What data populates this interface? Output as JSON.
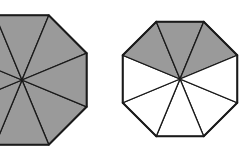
{
  "figure": {
    "background_color": "#ffffff",
    "shaded_color": "#9a9a9a",
    "unshaded_color": "#ffffff",
    "outline_color": "#1a1a1a",
    "sector_stroke_width": 1.3,
    "outline_stroke_width": 2.0,
    "shapes": [
      {
        "name": "left-octagon",
        "label": "left octagon",
        "sides": 8,
        "sectors_total": 8,
        "sectors_shaded": 8,
        "sectors_unshaded": 0,
        "fraction_shaded": "8/8",
        "center_x": 22,
        "center_y": 80,
        "radius": 70,
        "rotation_deg": 22.5,
        "clipped_at_left_edge": true,
        "sector_fills": [
          "shaded",
          "shaded",
          "shaded",
          "shaded",
          "shaded",
          "shaded",
          "shaded",
          "shaded"
        ]
      },
      {
        "name": "right-octagon",
        "label": "right octagon",
        "sides": 8,
        "sectors_total": 8,
        "sectors_shaded": 3,
        "sectors_unshaded": 5,
        "fraction_shaded": "3/8",
        "center_x": 180,
        "center_y": 79,
        "radius": 62,
        "rotation_deg": 22.5,
        "clipped_at_left_edge": false,
        "sector_fills": [
          "unshaded",
          "unshaded",
          "unshaded",
          "unshaded",
          "shaded",
          "shaded",
          "shaded",
          "unshaded"
        ]
      }
    ]
  }
}
